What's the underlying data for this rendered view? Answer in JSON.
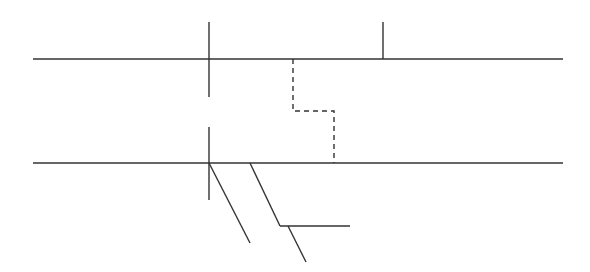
{
  "diagram": {
    "type": "line-diagram",
    "background": "#ffffff",
    "stroke_color": "#333333",
    "labels": [],
    "elements": {
      "upper_horizontal": {
        "x1": 33,
        "y1": 59,
        "x2": 563,
        "y2": 59,
        "style": "solid"
      },
      "lower_horizontal": {
        "x1": 33,
        "y1": 163,
        "x2": 563,
        "y2": 163,
        "style": "solid"
      },
      "upper_left_vertical": {
        "x1": 209,
        "y1": 22,
        "x2": 209,
        "y2": 97,
        "style": "solid"
      },
      "upper_right_tick": {
        "x1": 383,
        "y1": 22,
        "x2": 383,
        "y2": 59,
        "style": "solid"
      },
      "lower_left_vertical": {
        "x1": 209,
        "y1": 127,
        "x2": 209,
        "y2": 200,
        "style": "solid"
      },
      "dashed_step_path": {
        "points": "293,59 293,111 334,111 334,163",
        "style": "dashed"
      },
      "diagonal_1": {
        "x1": 209,
        "y1": 163,
        "x2": 250,
        "y2": 243,
        "style": "solid"
      },
      "diagonal_2": {
        "x1": 250,
        "y1": 163,
        "x2": 280,
        "y2": 226,
        "style": "solid"
      },
      "branch_horizontal": {
        "x1": 280,
        "y1": 226,
        "x2": 350,
        "y2": 226,
        "style": "solid"
      },
      "diagonal_3": {
        "x1": 288,
        "y1": 226,
        "x2": 306,
        "y2": 262,
        "style": "solid"
      }
    }
  }
}
